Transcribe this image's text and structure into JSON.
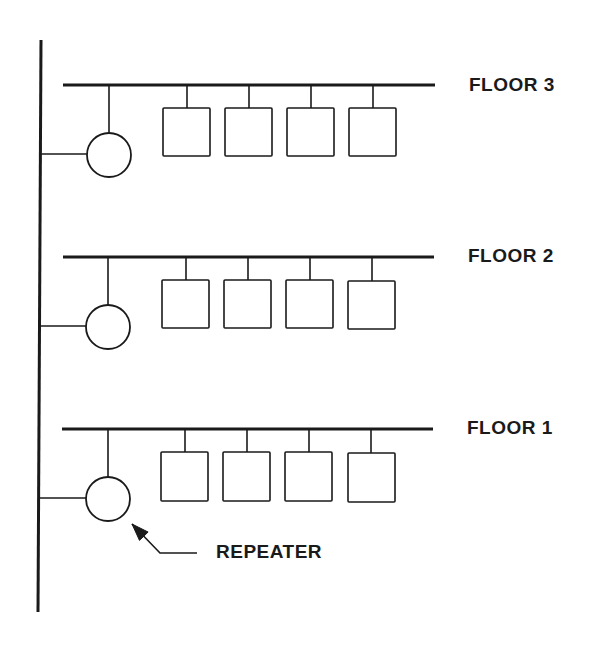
{
  "diagram": {
    "type": "network-topology",
    "colors": {
      "stroke": "#1a1a1a",
      "background": "#ffffff"
    },
    "backbone": {
      "x1": 41,
      "y1": 40,
      "x2": 38,
      "y2": 612
    },
    "floors": [
      {
        "label": "FLOOR 3",
        "bus_y": 85,
        "bus_x1": 63,
        "bus_x2": 435,
        "label_x": 469,
        "label_y": 75,
        "repeater": {
          "cx": 109,
          "cy": 155,
          "r": 22
        },
        "nodes": [
          {
            "x": 163,
            "y": 108,
            "w": 47,
            "h": 48,
            "stem_x": 187
          },
          {
            "x": 225,
            "y": 108,
            "w": 47,
            "h": 48,
            "stem_x": 249
          },
          {
            "x": 287,
            "y": 108,
            "w": 47,
            "h": 48,
            "stem_x": 311
          },
          {
            "x": 349,
            "y": 108,
            "w": 47,
            "h": 48,
            "stem_x": 373
          }
        ]
      },
      {
        "label": "FLOOR 2",
        "bus_y": 257,
        "bus_x1": 63,
        "bus_x2": 434,
        "label_x": 468,
        "label_y": 246,
        "repeater": {
          "cx": 108,
          "cy": 327,
          "r": 22
        },
        "nodes": [
          {
            "x": 162,
            "y": 280,
            "w": 47,
            "h": 48,
            "stem_x": 186
          },
          {
            "x": 224,
            "y": 280,
            "w": 47,
            "h": 48,
            "stem_x": 248
          },
          {
            "x": 286,
            "y": 280,
            "w": 47,
            "h": 48,
            "stem_x": 310
          },
          {
            "x": 348,
            "y": 281,
            "w": 47,
            "h": 48,
            "stem_x": 372
          }
        ]
      },
      {
        "label": "FLOOR 1",
        "bus_y": 429,
        "bus_x1": 62,
        "bus_x2": 433,
        "label_x": 467,
        "label_y": 418,
        "repeater": {
          "cx": 108,
          "cy": 499,
          "r": 22
        },
        "nodes": [
          {
            "x": 161,
            "y": 452,
            "w": 47,
            "h": 49,
            "stem_x": 185
          },
          {
            "x": 223,
            "y": 452,
            "w": 47,
            "h": 49,
            "stem_x": 247
          },
          {
            "x": 285,
            "y": 452,
            "w": 47,
            "h": 49,
            "stem_x": 309
          },
          {
            "x": 348,
            "y": 453,
            "w": 47,
            "h": 49,
            "stem_x": 371
          }
        ]
      }
    ],
    "callout": {
      "label": "REPEATER",
      "label_x": 216,
      "label_y": 542,
      "arrow_tip": {
        "x": 132,
        "y": 524
      },
      "elbow": {
        "x": 160,
        "y": 553
      },
      "end": {
        "x": 197,
        "y": 553
      }
    }
  }
}
